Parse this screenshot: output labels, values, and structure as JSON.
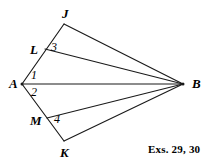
{
  "figure": {
    "type": "geometry-diagram",
    "background_color": "#ffffff",
    "stroke_color": "#1a1a1a",
    "width": 209,
    "height": 162,
    "points": {
      "A": {
        "label": "A",
        "x": 22,
        "y": 84,
        "label_x": 9,
        "label_y": 77
      },
      "B": {
        "label": "B",
        "x": 183,
        "y": 84,
        "label_x": 192,
        "label_y": 77
      },
      "J": {
        "label": "J",
        "x": 64,
        "y": 24,
        "label_x": 62,
        "label_y": 7
      },
      "L": {
        "label": "L",
        "x": 45,
        "y": 49,
        "label_x": 30,
        "label_y": 43
      },
      "M": {
        "label": "M",
        "x": 47,
        "y": 118,
        "label_x": 30,
        "label_y": 114
      },
      "K": {
        "label": "K",
        "x": 64,
        "y": 141,
        "label_x": 60,
        "label_y": 146
      }
    },
    "angles": [
      {
        "label": "1",
        "x": 31,
        "y": 69,
        "vertex": "A"
      },
      {
        "label": "2",
        "x": 31,
        "y": 86,
        "vertex": "A"
      },
      {
        "label": "3",
        "x": 51,
        "y": 41,
        "vertex": "L"
      },
      {
        "label": "4",
        "x": 54,
        "y": 113,
        "vertex": "M"
      }
    ],
    "segments": [
      {
        "name": "A-J",
        "from": "A",
        "to": "J"
      },
      {
        "name": "A-K",
        "from": "A",
        "to": "K"
      },
      {
        "name": "A-B",
        "from": "A",
        "to": "B"
      },
      {
        "name": "J-B",
        "from": "J",
        "to": "B"
      },
      {
        "name": "L-B",
        "from": "L",
        "to": "B"
      },
      {
        "name": "M-B",
        "from": "M",
        "to": "B"
      },
      {
        "name": "K-B",
        "from": "K",
        "to": "B"
      }
    ]
  },
  "caption": {
    "text": "Exs. 29, 30",
    "x": 148,
    "y": 143
  }
}
